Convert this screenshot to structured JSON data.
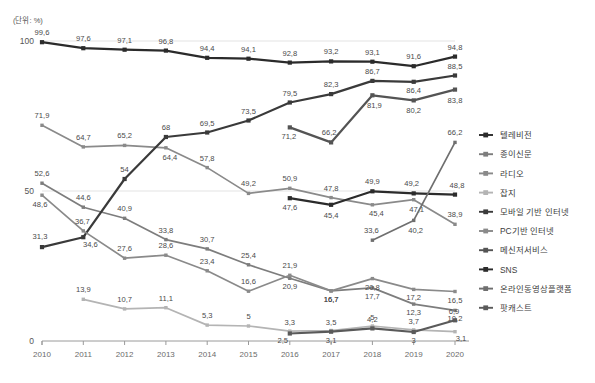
{
  "unit_label": "(단위: %)",
  "footnote": "",
  "axis": {
    "y_ticks": [
      "100",
      "50",
      "0"
    ],
    "y_min": 0,
    "y_max": 100,
    "x_ticks": [
      "2010",
      "2011",
      "2012",
      "2013",
      "2014",
      "2015",
      "2016",
      "2017",
      "2018",
      "2019",
      "2020"
    ]
  },
  "legend": {
    "position": "right",
    "items": [
      {
        "label": "텔레비전",
        "color": "#2b2b2b"
      },
      {
        "label": "종이신문",
        "color": "#7d7d7d"
      },
      {
        "label": "라디오",
        "color": "#8a8a8a"
      },
      {
        "label": "잡지",
        "color": "#b4b4b4"
      },
      {
        "label": "모바일 기반 인터넷",
        "color": "#3a3a3a"
      },
      {
        "label": "PC기반 인터넷",
        "color": "#8a8a8a"
      },
      {
        "label": "메신저서비스",
        "color": "#545454"
      },
      {
        "label": "SNS",
        "color": "#2b2b2b"
      },
      {
        "label": "온라인동영상플랫폼",
        "color": "#6f6f6f"
      },
      {
        "label": "팟캐스트",
        "color": "#5a5a5a"
      }
    ]
  },
  "chart_data": {
    "type": "line",
    "title": "",
    "subtitle": "",
    "xlabel": "",
    "ylabel": "",
    "unit": "%",
    "ylim": [
      0,
      100
    ],
    "grid": true,
    "legend_position": "right",
    "categories": [
      "2010",
      "2011",
      "2012",
      "2013",
      "2014",
      "2015",
      "2016",
      "2017",
      "2018",
      "2019",
      "2020"
    ],
    "series": [
      {
        "name": "텔레비전",
        "color": "#2b2b2b",
        "values": [
          99.6,
          97.6,
          97.1,
          96.8,
          94.4,
          94.1,
          92.8,
          93.2,
          93.1,
          91.6,
          94.8
        ],
        "labels": [
          "99,6",
          "97,6",
          "97,1",
          "96,8",
          "94,4",
          "94,1",
          "92,8",
          "93,2",
          "93,1",
          "91,6",
          "94,8"
        ]
      },
      {
        "name": "종이신문",
        "color": "#7d7d7d",
        "values": [
          52.6,
          44.6,
          40.9,
          33.8,
          30.7,
          25.4,
          20.9,
          16.7,
          17.7,
          12.3,
          10.2
        ],
        "labels": [
          "52,6",
          "44,6",
          "40,9",
          "33,8",
          "30,7",
          "25,4",
          "20,9",
          "16,7",
          "17,7",
          "12,3",
          "10,2"
        ]
      },
      {
        "name": "라디오",
        "color": "#8a8a8a",
        "values": [
          null,
          64.7,
          65.2,
          64.4,
          57.8,
          49.2,
          50.9,
          47.8,
          45.4,
          47.1,
          38.9
        ],
        "labels": [
          null,
          "64,7",
          "65,2",
          "64,4",
          "57,8",
          "49,2",
          "50,9",
          "47,8",
          "45,4",
          "47,1",
          "38,9"
        ],
        "first_label": "71,9",
        "first_value": 71.9
      },
      {
        "name": "잡지",
        "color": "#b4b4b4",
        "values": [
          null,
          13.9,
          10.7,
          11.1,
          5.3,
          5,
          3.3,
          3.5,
          5,
          3.7,
          3.1
        ],
        "labels": [
          null,
          "13,9",
          "10,7",
          "11,1",
          "5,3",
          "5",
          "3,3",
          "3,5",
          "5",
          "3,7",
          "3,1"
        ]
      },
      {
        "name": "모바일 기반 인터넷",
        "color": "#3a3a3a",
        "values": [
          31.3,
          34.6,
          54,
          68,
          69.5,
          73.5,
          79.5,
          82.3,
          86.7,
          86.4,
          88.5
        ],
        "labels": [
          "31,3",
          "34,6",
          "54",
          "68",
          "69,5",
          "73,5",
          "79,5",
          "82,3",
          "86,7",
          "86,4",
          "88,5"
        ]
      },
      {
        "name": "PC기반 인터넷",
        "color": "#8a8a8a",
        "values": [
          48.6,
          36.7,
          27.6,
          28.6,
          23.4,
          16.6,
          21.9,
          16.7,
          20.8,
          17.2,
          16.5
        ],
        "labels": [
          "48,6",
          "36,7",
          "27,6",
          "28,6",
          "23,4",
          "16,6",
          "21,9",
          "16,7",
          "20,8",
          "17,2",
          "16,5"
        ]
      },
      {
        "name": "메신저서비스",
        "color": "#545454",
        "values": [
          null,
          null,
          null,
          null,
          null,
          null,
          71.2,
          66.2,
          81.9,
          80.2,
          83.8
        ],
        "labels": [
          null,
          null,
          null,
          null,
          null,
          null,
          "71,2",
          "66,2",
          "81,9",
          "80,2",
          "83,8"
        ]
      },
      {
        "name": "SNS",
        "color": "#2b2b2b",
        "values": [
          null,
          null,
          null,
          null,
          null,
          null,
          47.6,
          45.4,
          49.9,
          49.2,
          48.8
        ],
        "labels": [
          null,
          null,
          null,
          null,
          null,
          null,
          "47,6",
          "45,4",
          "49,9",
          "49,2",
          "48,8"
        ]
      },
      {
        "name": "온라인동영상플랫폼",
        "color": "#6f6f6f",
        "values": [
          null,
          null,
          null,
          null,
          null,
          null,
          null,
          null,
          33.6,
          40.2,
          66.2
        ],
        "labels": [
          null,
          null,
          null,
          null,
          null,
          null,
          null,
          null,
          "33,6",
          "40,2",
          "66,2"
        ]
      },
      {
        "name": "팟캐스트",
        "color": "#5a5a5a",
        "values": [
          null,
          null,
          null,
          null,
          null,
          null,
          2.5,
          3.1,
          4.2,
          3,
          6.9
        ],
        "labels": [
          null,
          null,
          null,
          null,
          null,
          null,
          "2,5",
          "3,1",
          "4,2",
          "3",
          "6,9"
        ]
      }
    ]
  }
}
